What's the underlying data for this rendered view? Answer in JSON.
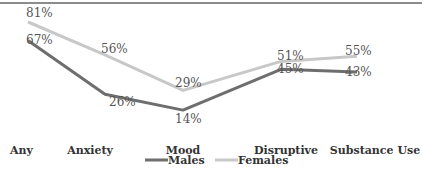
{
  "chart_data": {
    "type": "line",
    "title": "",
    "xlabel": "",
    "ylabel": "",
    "categories": [
      "Any",
      "Anxiety",
      "Mood",
      "Disruptive",
      "Substance Use"
    ],
    "series": [
      {
        "name": "Males",
        "color": "#6e6e6e",
        "values": [
          67,
          26,
          14,
          45,
          43
        ],
        "labels": [
          "67%",
          "26%",
          "14%",
          "45%",
          "43%"
        ]
      },
      {
        "name": "Females",
        "color": "#c8c8c8",
        "values": [
          81,
          56,
          29,
          51,
          55
        ],
        "labels": [
          "81%",
          "56%",
          "29%",
          "51%",
          "55%"
        ]
      }
    ],
    "ylim": [
      0,
      90
    ],
    "grid": false,
    "legend": "bottom-center"
  }
}
